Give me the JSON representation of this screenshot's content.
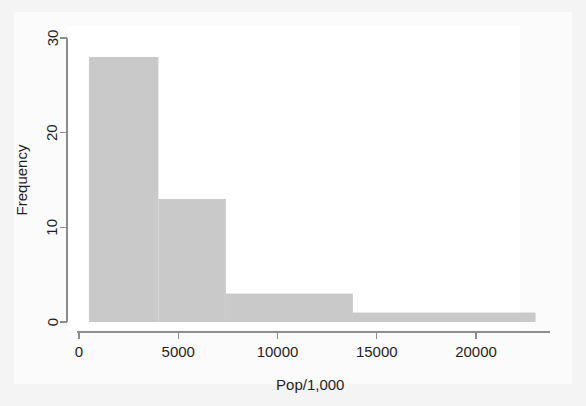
{
  "figure": {
    "width": 586,
    "height": 406,
    "page_background": "#f4f4f4",
    "panel_background": "#ffffff"
  },
  "chart_data": {
    "type": "bar",
    "subtype": "histogram",
    "title": "",
    "subtitle": "",
    "xlabel": "Pop/1,000",
    "ylabel": "Frequency",
    "xlim": [
      0,
      23300
    ],
    "ylim": [
      0,
      31
    ],
    "xticks": [
      0,
      5000,
      10000,
      15000,
      20000
    ],
    "xtick_labels": [
      "0",
      "5000",
      "10000",
      "15000",
      "20000"
    ],
    "yticks": [
      0,
      10,
      20,
      30
    ],
    "ytick_labels": [
      "0",
      "10",
      "20",
      "30"
    ],
    "grid": false,
    "legend": null,
    "bar_color": "#c9c9c9",
    "axis_color": "#8d8d8d",
    "text_color": "#1f1f1f",
    "bins": [
      {
        "left": 500,
        "right": 4000,
        "frequency": 28
      },
      {
        "left": 4000,
        "right": 7400,
        "frequency": 13
      },
      {
        "left": 7400,
        "right": 13800,
        "frequency": 3
      },
      {
        "left": 13800,
        "right": 23000,
        "frequency": 1
      }
    ],
    "categories": [
      "500-4000",
      "4000-7400",
      "7400-13800",
      "13800-23000"
    ],
    "values": [
      28,
      13,
      3,
      1
    ]
  }
}
